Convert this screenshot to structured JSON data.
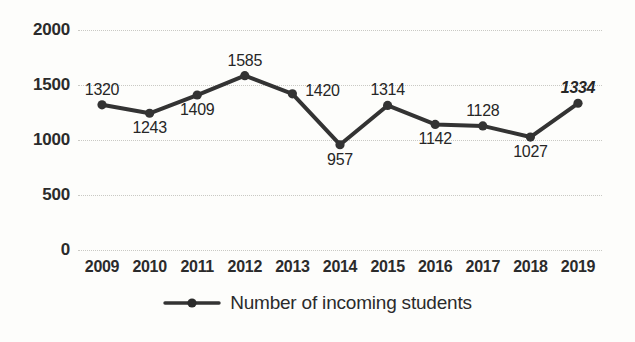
{
  "chart_data": {
    "type": "line",
    "title": "",
    "xlabel": "",
    "ylabel": "",
    "ylim": [
      0,
      2000
    ],
    "grid": true,
    "legend_position": "bottom",
    "categories": [
      "2009",
      "2010",
      "2011",
      "2012",
      "2013",
      "2014",
      "2015",
      "2016",
      "2017",
      "2018",
      "2019"
    ],
    "series": [
      {
        "name": "Number of incoming students",
        "values": [
          1320,
          1243,
          1409,
          1585,
          1420,
          957,
          1314,
          1142,
          1128,
          1027,
          1334
        ],
        "color": "#333333",
        "marker": "circle"
      }
    ],
    "y_ticks": [
      0,
      500,
      1000,
      1500,
      2000
    ],
    "y_tick_labels": [
      "0",
      "500",
      "1000",
      "1500",
      "2000"
    ],
    "data_labels": [
      {
        "text": "1320",
        "value": 1320,
        "position": "above",
        "emphasis": false
      },
      {
        "text": "1243",
        "value": 1243,
        "position": "below",
        "emphasis": false
      },
      {
        "text": "1409",
        "value": 1409,
        "position": "below",
        "emphasis": false
      },
      {
        "text": "1585",
        "value": 1585,
        "position": "above",
        "emphasis": false
      },
      {
        "text": "1420",
        "value": 1420,
        "position": "right",
        "emphasis": false
      },
      {
        "text": "957",
        "value": 957,
        "position": "below",
        "emphasis": false
      },
      {
        "text": "1314",
        "value": 1314,
        "position": "above",
        "emphasis": false
      },
      {
        "text": "1142",
        "value": 1142,
        "position": "below",
        "emphasis": false
      },
      {
        "text": "1128",
        "value": 1128,
        "position": "above",
        "emphasis": false
      },
      {
        "text": "1027",
        "value": 1027,
        "position": "below",
        "emphasis": false
      },
      {
        "text": "1334",
        "value": 1334,
        "position": "above",
        "emphasis": true
      }
    ]
  },
  "legend": {
    "label": "Number of incoming students"
  },
  "colors": {
    "line": "#333333",
    "marker": "#2b2b2b",
    "grid": "#c9c9c4",
    "text": "#2b2b2b",
    "background": "#fdfdfb"
  }
}
